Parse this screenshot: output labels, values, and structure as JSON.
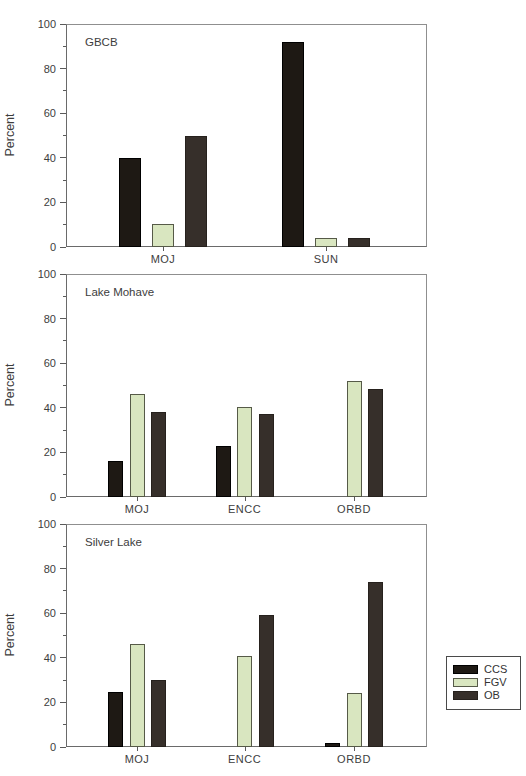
{
  "figure_title": "Percent composition bar charts",
  "ylabel": "Percent",
  "series_names": [
    "CCS",
    "FGV",
    "OB"
  ],
  "legend": {
    "items": [
      {
        "label": "CCS"
      },
      {
        "label": "FGV"
      },
      {
        "label": "OB"
      }
    ]
  },
  "chart_style": {
    "ccs_fill": "#1e1914",
    "ccs_border": "#000000",
    "fgv_fill": "#d9e6c0",
    "fgv_border": "#565a48",
    "ob_fill": "#362f2a",
    "ob_border": "#26211d",
    "axis_color": "#8f8f8f",
    "text_color": "#3d3d3d"
  },
  "chart_data": [
    {
      "type": "bar",
      "title": "GBCB",
      "ylabel": "Percent",
      "ylim": [
        0,
        100
      ],
      "yticks": [
        0,
        20,
        40,
        60,
        80,
        100
      ],
      "grid": false,
      "categories": [
        "MOJ",
        "SUN"
      ],
      "series": [
        {
          "name": "CCS",
          "values": [
            40,
            92
          ]
        },
        {
          "name": "FGV",
          "values": [
            10.5,
            4
          ]
        },
        {
          "name": "OB",
          "values": [
            50,
            4
          ]
        }
      ]
    },
    {
      "type": "bar",
      "title": "Lake Mohave",
      "ylabel": "Percent",
      "ylim": [
        0,
        100
      ],
      "yticks": [
        0,
        20,
        40,
        60,
        80,
        100
      ],
      "grid": false,
      "categories": [
        "MOJ",
        "ENCC",
        "ORBD"
      ],
      "series": [
        {
          "name": "CCS",
          "values": [
            16,
            23,
            0
          ]
        },
        {
          "name": "FGV",
          "values": [
            46,
            40.5,
            52
          ]
        },
        {
          "name": "OB",
          "values": [
            38,
            37,
            48.5
          ]
        }
      ]
    },
    {
      "type": "bar",
      "title": "Silver Lake",
      "ylabel": "Percent",
      "ylim": [
        0,
        100
      ],
      "yticks": [
        0,
        20,
        40,
        60,
        80,
        100
      ],
      "grid": false,
      "categories": [
        "MOJ",
        "ENCC",
        "ORBD"
      ],
      "series": [
        {
          "name": "CCS",
          "values": [
            24.5,
            0,
            2
          ]
        },
        {
          "name": "FGV",
          "values": [
            46,
            41,
            24
          ]
        },
        {
          "name": "OB",
          "values": [
            30,
            59,
            74
          ]
        }
      ]
    }
  ],
  "legend_position": "right-bottom"
}
